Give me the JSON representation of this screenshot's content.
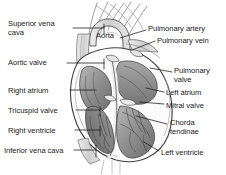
{
  "diagram": {
    "style": "grayscale pencil / engraving anatomical illustration",
    "background_color": "#ffffff",
    "ink_color": "#1a1a1a",
    "labels_left": [
      {
        "id": "superior-vena-cava",
        "text": "Superior vena\ncava",
        "x": 8,
        "y": 19
      },
      {
        "id": "aortic-valve",
        "text": "Aortic valve",
        "x": 8,
        "y": 58
      },
      {
        "id": "right-atrium",
        "text": "Right atrium",
        "x": 8,
        "y": 86
      },
      {
        "id": "tricuspid-valve",
        "text": "Tricuspid valve",
        "x": 8,
        "y": 106
      },
      {
        "id": "right-ventricle",
        "text": "Right ventricle",
        "x": 8,
        "y": 126
      },
      {
        "id": "inferior-vena-cava",
        "text": "Inferior vena cava",
        "x": 4,
        "y": 146
      }
    ],
    "labels_right": [
      {
        "id": "pulmonary-artery",
        "text": "Pulmonary artery",
        "x": 148,
        "y": 24
      },
      {
        "id": "pulmonary-vein",
        "text": "Pulmonary vein",
        "x": 157,
        "y": 36
      },
      {
        "id": "pulmonary-valve",
        "text": "Pulmonary\nvalve",
        "x": 174,
        "y": 66
      },
      {
        "id": "left-atrium",
        "text": "Left atrium",
        "x": 166,
        "y": 88
      },
      {
        "id": "mitral-valve",
        "text": "Mitral valve",
        "x": 166,
        "y": 101
      },
      {
        "id": "chorda-tendinae",
        "text": "Chorda\ntendinae",
        "x": 170,
        "y": 118
      },
      {
        "id": "left-ventricle",
        "text": "Left ventricle",
        "x": 161,
        "y": 148
      }
    ],
    "labels_center": [
      {
        "id": "aorta",
        "text": "Aorta",
        "x": 96,
        "y": 31
      }
    ]
  }
}
